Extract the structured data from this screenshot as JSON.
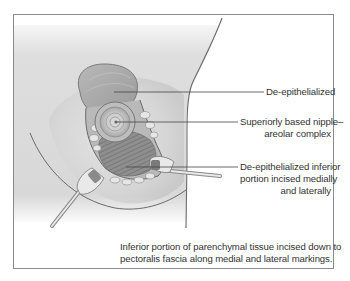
{
  "figure": {
    "labels": {
      "de_epithelialized": "De-epithelialized",
      "nac_line1": "Superiorly based nipple–",
      "nac_line2": "areolar complex",
      "inferior_line1": "De-epithelialized inferior",
      "inferior_line2": "portion incised medially",
      "inferior_line3": "and laterally"
    },
    "caption": {
      "line1": "Inferior portion of parenchymal tissue incised down to",
      "line2": "pectoralis fascia along medial and lateral markings."
    },
    "colors": {
      "frame": "#8a8a8a",
      "skin_shadow": "#d4d4d4",
      "outline": "#5a5a5a",
      "text": "#333333"
    }
  }
}
